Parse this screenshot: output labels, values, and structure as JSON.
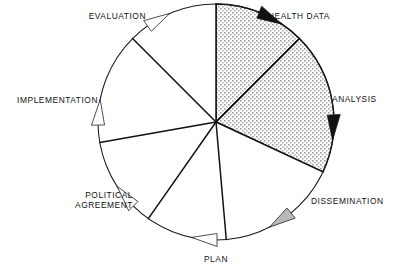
{
  "figure": {
    "center": {
      "x": 216,
      "y": 122
    },
    "radius": 118,
    "colors": {
      "outline": "#1a1a1a",
      "spoke": "#111111",
      "shaded_fill": "#d9d9d9",
      "plain_fill": "#ffffff",
      "arrow_dark": "#111111",
      "arrow_mid": "#b9b9b9",
      "arrow_light": "#fefefe",
      "text": "#111111",
      "background": "#ffffff"
    }
  },
  "chart_data": {
    "type": "pie",
    "title": "",
    "xlabel": "",
    "ylabel": "",
    "legend": "none",
    "grid": false,
    "note": "Seven-segment cycle wheel; angles measured clockwise from 12 o'clock.",
    "categories": [
      "HEALTH DATA",
      "ANALYSIS",
      "DISSEMINATION",
      "PLAN",
      "POLITICAL AGREEMENT",
      "IMPLEMENTATION",
      "EVALUATION"
    ],
    "values": [
      45,
      70,
      60,
      40,
      45,
      55,
      45
    ],
    "segments": [
      {
        "label": "HEALTH DATA",
        "label_lines": [
          "HEALTH  DATA"
        ],
        "start_angle": 0,
        "end_angle": 45,
        "shaded": true,
        "arrow_style": "dark",
        "arrow_angle": 27,
        "label_x": 268,
        "label_y": 19,
        "label_anchor": "start"
      },
      {
        "label": "ANALYSIS",
        "label_lines": [
          "ANALYSIS"
        ],
        "start_angle": 45,
        "end_angle": 115,
        "shaded": true,
        "arrow_style": "dark",
        "arrow_angle": 92,
        "label_x": 332,
        "label_y": 102,
        "label_anchor": "start"
      },
      {
        "label": "DISSEMINATION",
        "label_lines": [
          "DISSEMINATION"
        ],
        "start_angle": 115,
        "end_angle": 175,
        "shaded": false,
        "arrow_style": "mid",
        "arrow_angle": 146,
        "label_x": 311,
        "label_y": 204,
        "label_anchor": "start"
      },
      {
        "label": "PLAN",
        "label_lines": [
          "PLAN"
        ],
        "start_angle": 175,
        "end_angle": 215,
        "shaded": false,
        "arrow_style": "light",
        "arrow_angle": 185,
        "label_x": 216,
        "label_y": 262,
        "label_anchor": "middle"
      },
      {
        "label": "POLITICAL AGREEMENT",
        "label_lines": [
          "POLITICAL",
          "AGREEMENT"
        ],
        "start_angle": 215,
        "end_angle": 260,
        "shaded": false,
        "arrow_style": "light",
        "arrow_angle": 230,
        "label_x": 133,
        "label_y": 203,
        "label_anchor": "end"
      },
      {
        "label": "IMPLEMENTATION",
        "label_lines": [
          "IMPLEMENTATION"
        ],
        "start_angle": 260,
        "end_angle": 315,
        "shaded": false,
        "arrow_style": "light",
        "arrow_angle": 274,
        "label_x": 98,
        "label_y": 103,
        "label_anchor": "end"
      },
      {
        "label": "EVALUATION",
        "label_lines": [
          "EVALUATION"
        ],
        "start_angle": 315,
        "end_angle": 360,
        "shaded": false,
        "arrow_style": "light",
        "arrow_angle": 330,
        "label_x": 146,
        "label_y": 19,
        "label_anchor": "end"
      }
    ]
  }
}
